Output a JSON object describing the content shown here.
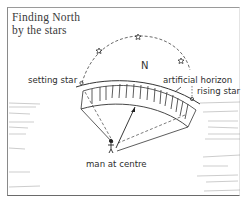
{
  "diagram": {
    "title_line1": "Finding North",
    "title_line2": "by the stars",
    "labels": {
      "north": "N",
      "setting_star": "setting star",
      "artificial_horizon": "artificial horizon",
      "rising_star": "rising star",
      "man_at_centre": "man at centre"
    },
    "elements": {
      "star_path": "dashed arc of star across sky",
      "stars": [
        "setting star",
        "star",
        "star",
        "star",
        "rising star"
      ],
      "horizon": "curved artificial horizon wall with vertical stakes",
      "observer": "man at centre with sight lines and arrow toward north"
    },
    "colors": {
      "ink": "#2e2e2e",
      "background": "#ffffff",
      "frame": "#8a8a8a"
    }
  }
}
